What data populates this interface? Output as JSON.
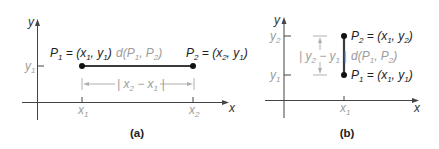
{
  "colors": {
    "line": "#3a3a3a",
    "text": "#222222",
    "muted": "#9c9c9c",
    "background": "#ffffff"
  },
  "panel_a": {
    "caption": "(a)",
    "axis_x_label": "x",
    "axis_y_label": "y",
    "y_tick_label": [
      {
        "t": "y"
      },
      {
        "sub": "1"
      }
    ],
    "x_tick_labels": [
      [
        {
          "t": "x"
        },
        {
          "sub": "1"
        }
      ],
      [
        {
          "t": "x"
        },
        {
          "sub": "2"
        }
      ]
    ],
    "point_1_label": [
      {
        "t": "P"
      },
      {
        "sub": "1"
      },
      {
        "t": " = (x"
      },
      {
        "sub": "1"
      },
      {
        "t": ", y"
      },
      {
        "sub": "1"
      },
      {
        "t": ")"
      }
    ],
    "point_2_label": [
      {
        "t": "P"
      },
      {
        "sub": "2"
      },
      {
        "t": " = (x"
      },
      {
        "sub": "2"
      },
      {
        "t": ", y"
      },
      {
        "sub": "1"
      },
      {
        "t": ")"
      }
    ],
    "distance_label": [
      {
        "t": "d(P"
      },
      {
        "sub": "1"
      },
      {
        "t": ", P"
      },
      {
        "sub": "2"
      },
      {
        "t": ")"
      }
    ],
    "difference_label": [
      {
        "t": "| x"
      },
      {
        "sub": "2"
      },
      {
        "t": " − x"
      },
      {
        "sub": "1"
      },
      {
        "t": " |"
      }
    ]
  },
  "panel_b": {
    "caption": "(b)",
    "axis_x_label": "x",
    "axis_y_label": "y",
    "y_tick_labels": [
      [
        {
          "t": "y"
        },
        {
          "sub": "2"
        }
      ],
      [
        {
          "t": "y"
        },
        {
          "sub": "1"
        }
      ]
    ],
    "x_tick_label": [
      {
        "t": "x"
      },
      {
        "sub": "1"
      }
    ],
    "point_2_label": [
      {
        "t": "P"
      },
      {
        "sub": "2"
      },
      {
        "t": " = (x"
      },
      {
        "sub": "1"
      },
      {
        "t": ", y"
      },
      {
        "sub": "2"
      },
      {
        "t": ")"
      }
    ],
    "point_1_label": [
      {
        "t": "P"
      },
      {
        "sub": "1"
      },
      {
        "t": " = (x"
      },
      {
        "sub": "1"
      },
      {
        "t": ", y"
      },
      {
        "sub": "1"
      },
      {
        "t": ")"
      }
    ],
    "distance_label": [
      {
        "t": "d(P"
      },
      {
        "sub": "1"
      },
      {
        "t": ", P"
      },
      {
        "sub": "2"
      },
      {
        "t": ")"
      }
    ],
    "difference_label": [
      {
        "t": "| y"
      },
      {
        "sub": "2"
      },
      {
        "t": " − y"
      },
      {
        "sub": "1"
      },
      {
        "t": " |"
      }
    ]
  }
}
